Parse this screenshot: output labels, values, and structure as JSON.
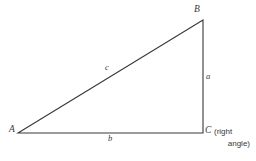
{
  "figure": {
    "kind": "right-triangle-diagram",
    "background_color": "#ffffff",
    "stroke_color": "#38383a",
    "text_color": "#38383a",
    "stroke_width": 1.1
  },
  "vertices": {
    "a": {
      "label": "A",
      "x": 18,
      "y": 133
    },
    "b": {
      "label": "B",
      "x": 203,
      "y": 20
    },
    "c": {
      "label": "C",
      "x": 203,
      "y": 133
    }
  },
  "sides": {
    "a": {
      "label": "a",
      "from": "B",
      "to": "C",
      "orientation": "vertical"
    },
    "b": {
      "label": "b",
      "from": "A",
      "to": "C",
      "orientation": "horizontal"
    },
    "c": {
      "label": "c",
      "from": "A",
      "to": "B",
      "orientation": "hypotenuse"
    }
  },
  "annotations": {
    "right_angle_note_line1": "(right",
    "right_angle_note_line2": "angle)"
  }
}
